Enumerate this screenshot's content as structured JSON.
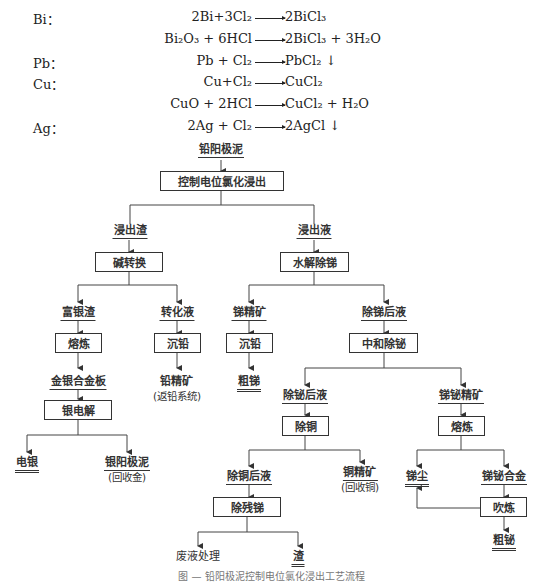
{
  "equations": {
    "elements": [
      {
        "label": "Bi：",
        "y": 17
      },
      {
        "label": "Pb：",
        "y": 61
      },
      {
        "label": "Cu：",
        "y": 82
      },
      {
        "label": "Ag：",
        "y": 126
      }
    ],
    "reactions": [
      {
        "element": "Bi",
        "lhs": "2Bi+3Cl₂",
        "rhs": "2BiCl₃",
        "y": 17
      },
      {
        "element": "Bi",
        "lhs": "Bi₂O₃ + 6HCl",
        "rhs": "2BiCl₃ + 3H₂O",
        "y": 39
      },
      {
        "element": "Pb",
        "lhs": "Pb + Cl₂",
        "rhs": "PbCl₂ ↓",
        "y": 61
      },
      {
        "element": "Cu",
        "lhs": "Cu+Cl₂",
        "rhs": "CuCl₂",
        "y": 82
      },
      {
        "element": "Cu",
        "lhs": "CuO + 2HCl",
        "rhs": "CuCl₂ + H₂O",
        "y": 104
      },
      {
        "element": "Ag",
        "lhs": "2Ag + Cl₂",
        "rhs": "2AgCl ↓",
        "y": 126
      }
    ]
  },
  "flowchart": {
    "start": "铅阳极泥",
    "processes": {
      "leach": "控制电位氯化浸出",
      "alkali_conversion": "碱转换",
      "hydrolysis": "水解除锑",
      "smelt_ag": "熔炼",
      "pb_precip_1": "沉铅",
      "pb_precip_2": "沉铅",
      "neutralize": "中和除铋",
      "ag_electrolysis": "银电解",
      "cu_removal": "除铜",
      "smelt_sb": "熔炼",
      "residual_sb": "除残锑",
      "blowing": "吹炼"
    },
    "materials": {
      "leach_residue": "浸出渣",
      "leach_liquor": "浸出液",
      "ag_rich_residue": "富银渣",
      "conversion_liquor": "转化液",
      "sb_concentrate": "锑精矿",
      "after_sb_liquor": "除锑后液",
      "au_ag_alloy": "金银合金板",
      "pb_concentrate": "铅精矿",
      "pb_concentrate_note": "(返铅系统)",
      "crude_sb": "粗锑",
      "electro_ag": "电银",
      "ag_anode_slime": "银阳极泥",
      "ag_anode_slime_note": "(回收金)",
      "after_bi_liquor": "除铋后液",
      "sb_bi_concentrate": "锑铋精矿",
      "after_cu_liquor": "除铜后液",
      "cu_concentrate": "铜精矿",
      "cu_concentrate_note": "(回收铜)",
      "sb_dust": "锑尘",
      "sb_bi_alloy": "锑铋合金",
      "waste_treatment": "废液处理",
      "slag": "渣",
      "crude_bi": "粗铋"
    }
  },
  "caption": "图 — 铅阳极泥控制电位氯化浸出工艺流程"
}
